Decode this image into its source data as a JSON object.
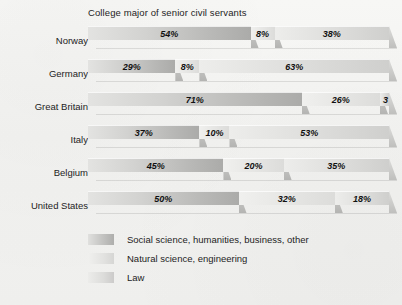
{
  "chart_data": {
    "type": "bar",
    "title": "College major of senior civil servants",
    "xlabel": "",
    "ylabel": "",
    "orientation": "horizontal",
    "stacked": true,
    "units": "percent",
    "xlim": [
      0,
      100
    ],
    "grid": false,
    "legend_position": "bottom-left",
    "categories": [
      "Norway",
      "Germany",
      "Great Britain",
      "Italy",
      "Belgium",
      "United States"
    ],
    "series": [
      {
        "name": "Social science, humanities, business, other",
        "values": [
          54,
          29,
          71,
          37,
          45,
          50
        ],
        "labels": [
          "54%",
          "29%",
          "71%",
          "37%",
          "45%",
          "50%"
        ]
      },
      {
        "name": "Natural science, engineering",
        "values": [
          8,
          8,
          26,
          10,
          20,
          32
        ],
        "labels": [
          "8%",
          "8%",
          "26%",
          "10%",
          "20%",
          "32%"
        ]
      },
      {
        "name": "Law",
        "values": [
          38,
          63,
          3,
          53,
          35,
          18
        ],
        "labels": [
          "38%",
          "63%",
          "3",
          "53%",
          "35%",
          "18%"
        ]
      }
    ]
  },
  "chart": {
    "title": "College major of senior civil servants",
    "rows": [
      {
        "label": "Norway",
        "segments": [
          {
            "value": 54,
            "label": "54%",
            "tone": "tone1"
          },
          {
            "value": 8,
            "label": "8%",
            "tone": "tone2"
          },
          {
            "value": 38,
            "label": "38%",
            "tone": "tone3"
          }
        ]
      },
      {
        "label": "Germany",
        "segments": [
          {
            "value": 29,
            "label": "29%",
            "tone": "tone1"
          },
          {
            "value": 8,
            "label": "8%",
            "tone": "tone2"
          },
          {
            "value": 63,
            "label": "63%",
            "tone": "tone3"
          }
        ]
      },
      {
        "label": "Great Britain",
        "segments": [
          {
            "value": 71,
            "label": "71%",
            "tone": "tone1"
          },
          {
            "value": 26,
            "label": "26%",
            "tone": "tone2"
          },
          {
            "value": 3,
            "label": "3",
            "tone": "tone3",
            "clipped": true
          }
        ]
      },
      {
        "label": "Italy",
        "segments": [
          {
            "value": 37,
            "label": "37%",
            "tone": "tone1"
          },
          {
            "value": 10,
            "label": "10%",
            "tone": "tone2"
          },
          {
            "value": 53,
            "label": "53%",
            "tone": "tone3"
          }
        ]
      },
      {
        "label": "Belgium",
        "segments": [
          {
            "value": 45,
            "label": "45%",
            "tone": "tone1"
          },
          {
            "value": 20,
            "label": "20%",
            "tone": "tone2"
          },
          {
            "value": 35,
            "label": "35%",
            "tone": "tone3"
          }
        ]
      },
      {
        "label": "United States",
        "segments": [
          {
            "value": 50,
            "label": "50%",
            "tone": "tone1"
          },
          {
            "value": 32,
            "label": "32%",
            "tone": "tone2"
          },
          {
            "value": 18,
            "label": "18%",
            "tone": "tone3"
          }
        ]
      }
    ],
    "legend": [
      {
        "label": "Social science, humanities, business, other",
        "tone": "tone1"
      },
      {
        "label": "Natural science, engineering",
        "tone": "tone2"
      },
      {
        "label": "Law",
        "tone": "tone3"
      }
    ]
  },
  "colors": {
    "background": "#f4f4f2",
    "text": "#1d1d1d",
    "series_1": "#b9b9b7",
    "series_2": "#e6e6e4",
    "series_3": "#dcdcda"
  }
}
